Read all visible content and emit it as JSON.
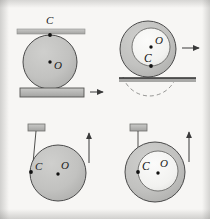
{
  "figure": {
    "background_color": "#f7f6f4",
    "body_fill": "#bdbdbd",
    "hub_fill": "#f2f2f0",
    "outline_color": "#4a4a4a",
    "bar_fill": "#b5b5b5",
    "point_color": "#121212",
    "label_color": "#1b1b1b"
  },
  "panels": [
    {
      "id": "panel-top-left",
      "name": "cylinder-between-two-plates",
      "labels": {
        "contact_point": "C",
        "centre": "O"
      },
      "geometry": {
        "circle": {
          "cx": 50,
          "cy": 62,
          "r": 27
        },
        "top_bar": {
          "x": 17,
          "y": 29,
          "w": 68,
          "h": 5
        },
        "bottom_bar": {
          "x": 20,
          "y": 88,
          "w": 64,
          "h": 9
        },
        "point_c": {
          "x": 50,
          "y": 35
        },
        "point_o": {
          "x": 50,
          "y": 62
        },
        "label_c": {
          "x": 47,
          "y": 24
        },
        "label_o": {
          "x": 54,
          "y": 68
        }
      },
      "arrow": {
        "name": "bottom-plate-velocity-arrow",
        "direction": "right",
        "x1": 90,
        "y1": 92,
        "x2": 104,
        "y2": 92
      }
    },
    {
      "id": "panel-top-right",
      "name": "wheel-with-hub-rolling-on-rail",
      "labels": {
        "contact_point": "C",
        "centre": "O"
      },
      "geometry": {
        "outer_circle": {
          "cx": 148,
          "cy": 49,
          "r": 28
        },
        "inner_circle": {
          "cx": 151,
          "cy": 47,
          "r": 19
        },
        "ground_line": {
          "x1": 119,
          "y1": 78,
          "x2": 196,
          "y2": 78
        },
        "dashed_arc_rx": 28,
        "point_c": {
          "x": 151,
          "y": 66
        },
        "point_o": {
          "x": 151,
          "y": 47
        },
        "label_c": {
          "x": 145,
          "y": 62
        },
        "label_o": {
          "x": 155,
          "y": 44
        }
      },
      "arrow": {
        "name": "wheel-velocity-arrow",
        "direction": "right",
        "x1": 182,
        "y1": 48,
        "x2": 200,
        "y2": 48
      }
    },
    {
      "id": "panel-bottom-left",
      "name": "cylinder-on-cord-unwinding-from-rim",
      "labels": {
        "contact_point": "C",
        "centre": "O"
      },
      "geometry": {
        "circle": {
          "cx": 57,
          "cy": 173,
          "r": 28
        },
        "bracket": {
          "x": 28,
          "y": 124,
          "w": 17,
          "h": 7
        },
        "cord": {
          "x1": 36,
          "y1": 131,
          "x2": 33,
          "y2": 173
        },
        "point_c": {
          "x": 31,
          "y": 172
        },
        "point_o": {
          "x": 58,
          "y": 173
        },
        "label_c": {
          "x": 36,
          "y": 170
        },
        "label_o": {
          "x": 61,
          "y": 168
        }
      },
      "arrow": {
        "name": "rim-velocity-arrow",
        "direction": "up",
        "x1": 89,
        "y1": 162,
        "x2": 89,
        "y2": 133
      }
    },
    {
      "id": "panel-bottom-right",
      "name": "wheel-with-hub-on-cord-unwinding-from-hub",
      "labels": {
        "contact_point": "C",
        "centre": "O"
      },
      "geometry": {
        "outer_circle": {
          "cx": 155,
          "cy": 172,
          "r": 30
        },
        "inner_circle": {
          "cx": 158,
          "cy": 171,
          "r": 20
        },
        "bracket": {
          "x": 130,
          "y": 124,
          "w": 17,
          "h": 7
        },
        "cord": {
          "x1": 138,
          "y1": 131,
          "x2": 138,
          "y2": 172
        },
        "point_c": {
          "x": 138,
          "y": 172
        },
        "point_o": {
          "x": 158,
          "y": 172
        },
        "label_c": {
          "x": 142,
          "y": 170
        },
        "label_o": {
          "x": 161,
          "y": 166
        }
      },
      "arrow": {
        "name": "rim-velocity-arrow",
        "direction": "up",
        "x1": 189,
        "y1": 162,
        "x2": 189,
        "y2": 131
      }
    }
  ]
}
